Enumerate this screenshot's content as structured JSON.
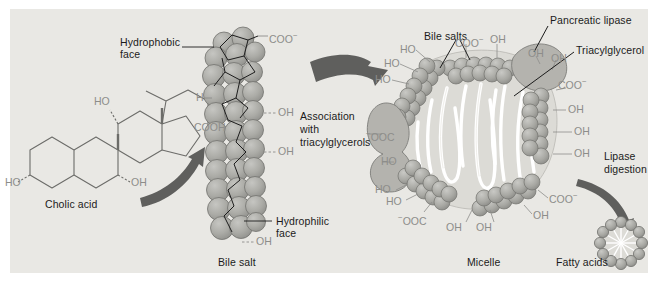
{
  "figure": {
    "background": "#e9e8e4",
    "sphere_fill": "#a9a9a5",
    "sphere_stroke": "#6f6f6c",
    "arrow_fill": "#5f5f5d",
    "chem_text_color": "#8d8d8a",
    "label_color": "#1b1b1b"
  },
  "stage1": {
    "molecule_name": "Cholic acid",
    "groups": {
      "oh_top": "HO",
      "oh_left": "HO",
      "oh_right": "OH",
      "cooh": "COOH"
    }
  },
  "stage2": {
    "name": "Bile salt",
    "hydrophobic_label": "Hydrophobic\nface",
    "hydrophobic_line1": "Hydrophobic",
    "hydrophobic_line2": "face",
    "hydrophilic_line1": "Hydrophilic",
    "hydrophilic_line2": "face",
    "groups": {
      "coo": "COO",
      "coo_charge": "−",
      "oh1": "OH",
      "oh2": "OH",
      "oh3": "OH",
      "oh_left": "H"
    }
  },
  "arrow1": {
    "caption_line1": "Association",
    "caption_line2": "with",
    "caption_line3": "triacylglycerols"
  },
  "stage3": {
    "name": "Micelle",
    "labels": {
      "bile_salts": "Bile salts",
      "pancreatic_lipase": "Pancreatic lipase",
      "triacylglycerol": "Triacylglycerol"
    },
    "groups": {
      "top_coo": "COO",
      "top_coo_charge": "−",
      "top_oh": "OH",
      "lipase_oh1": "OH",
      "lipase_oh2": "OH",
      "right_coo": "COO",
      "right_coo_charge": "−",
      "right_oh1": "OH",
      "right_oh2": "OH",
      "right_oh3": "OH",
      "ul_ho1": "HO",
      "ul_ho2": "HO",
      "ul_ho3": "HO",
      "left_ooc": "OOC",
      "left_ooc_charge": "−",
      "left_ho": "HO",
      "ll_ho1": "HO",
      "ll_ho2": "HO",
      "ll_ooc": "OOC",
      "ll_ooc_charge": "−",
      "bottom_oh1": "OH",
      "bottom_oh2": "OH",
      "br_coo": "COO",
      "br_coo_charge": "−",
      "br_oh": "OH"
    }
  },
  "arrow2": {
    "caption_line1": "Lipase",
    "caption_line2": "digestion"
  },
  "stage4": {
    "name": "Fatty acids",
    "sphere_count": 12
  }
}
